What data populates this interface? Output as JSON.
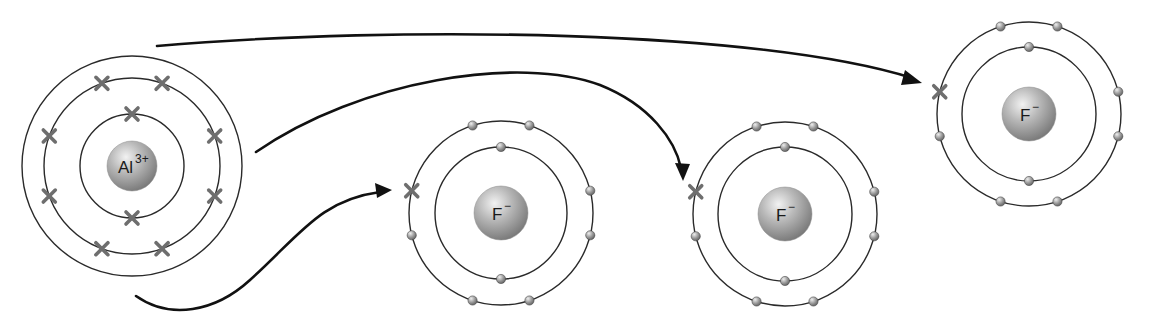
{
  "colors": {
    "shell": "#2a2a2a",
    "arrow": "#111111",
    "transferred_electron": "#6e6e6e",
    "electron_dot": "#8a8a8a",
    "nucleus": "#a8a8a8"
  },
  "ions": [
    {
      "id": "al",
      "symbol": "Al",
      "charge": "3+",
      "electron_marker": "cross",
      "shells": [
        {
          "electrons": 2
        },
        {
          "electrons": 8
        }
      ],
      "outer_shell_empty": true,
      "note": "Al ion after losing 3 electrons; outer (third) shell shown empty"
    },
    {
      "id": "f1",
      "symbol": "F",
      "charge": "−",
      "electron_marker": "dot",
      "shells": [
        {
          "electrons": 2
        },
        {
          "electrons": 8,
          "transferred": 1
        }
      ]
    },
    {
      "id": "f2",
      "symbol": "F",
      "charge": "−",
      "electron_marker": "dot",
      "shells": [
        {
          "electrons": 2
        },
        {
          "electrons": 8,
          "transferred": 1
        }
      ]
    },
    {
      "id": "f3",
      "symbol": "F",
      "charge": "−",
      "electron_marker": "dot",
      "shells": [
        {
          "electrons": 2
        },
        {
          "electrons": 8,
          "transferred": 1
        }
      ]
    }
  ],
  "arrows": [
    {
      "from": "al",
      "to": "f3",
      "meaning": "electron transfer"
    },
    {
      "from": "al",
      "to": "f2",
      "meaning": "electron transfer"
    },
    {
      "from": "al",
      "to": "f1",
      "meaning": "electron transfer"
    }
  ]
}
